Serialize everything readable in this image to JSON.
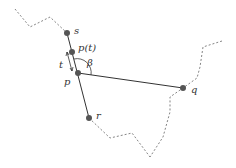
{
  "diagram": {
    "type": "geometric construction",
    "colors": {
      "line": "#333333",
      "point": "#555555",
      "dashed": "#777777"
    },
    "points": [
      {
        "id": "s",
        "label": "s",
        "x": 67,
        "y": 33,
        "lx": 74,
        "ly": 34
      },
      {
        "id": "pt",
        "label": "p(t)",
        "x": 72,
        "y": 52,
        "lx": 78,
        "ly": 51
      },
      {
        "id": "p",
        "label": "p",
        "x": 78,
        "y": 73,
        "lx": 64,
        "ly": 85
      },
      {
        "id": "q",
        "label": "q",
        "x": 183,
        "y": 88,
        "lx": 191,
        "ly": 93
      },
      {
        "id": "r",
        "label": "r",
        "x": 89,
        "y": 118,
        "lx": 96,
        "ly": 119
      }
    ],
    "angle_label": {
      "label": "β",
      "x": 87,
      "y": 66
    },
    "t_label": {
      "label": "t",
      "x": 60,
      "y": 68
    },
    "solid_segments": [
      {
        "from": "s",
        "to": "r"
      },
      {
        "from": "p",
        "to": "q"
      }
    ],
    "dashed_paths": [
      "15,9 30,27 50,17 67,33",
      "222,41 203,47 200,67 197,78 183,88 170,97 170,112 163,137 150,157",
      "89,118 110,138 132,133 150,157"
    ]
  }
}
